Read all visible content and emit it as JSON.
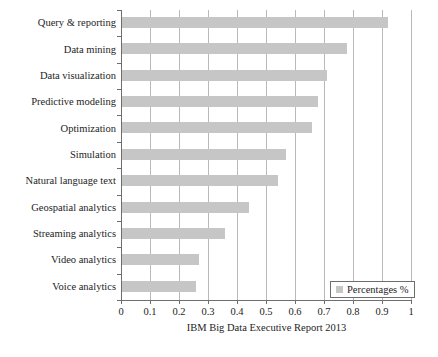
{
  "chart_data": {
    "type": "bar",
    "orientation": "horizontal",
    "title": "",
    "xlabel": "IBM Big Data Executive Report 2013",
    "ylabel": "",
    "xlim": [
      0,
      1
    ],
    "grid": "vertical",
    "legend_position": "bottom-right",
    "bar_color": "#c6c6c6",
    "categories": [
      "Query & reporting",
      "Data mining",
      "Data visualization",
      "Predictive modeling",
      "Optimization",
      "Simulation",
      "Natural language text",
      "Geospatial analytics",
      "Streaming analytics",
      "Video analytics",
      "Voice analytics"
    ],
    "values": [
      0.92,
      0.78,
      0.71,
      0.68,
      0.66,
      0.57,
      0.54,
      0.44,
      0.36,
      0.27,
      0.26
    ],
    "series": [
      {
        "name": "Percentages %",
        "values": [
          0.92,
          0.78,
          0.71,
          0.68,
          0.66,
          0.57,
          0.54,
          0.44,
          0.36,
          0.27,
          0.26
        ]
      }
    ],
    "xticks": [
      0,
      0.1,
      0.2,
      0.3,
      0.4,
      0.5,
      0.6,
      0.7,
      0.8,
      0.9,
      1
    ],
    "xtick_labels": [
      "0",
      "0.1",
      "0.2",
      "0.3",
      "0.4",
      "0.5",
      "0.6",
      "0.7",
      "0.8",
      "0.9",
      "1"
    ]
  },
  "legend": {
    "label": "Percentages %",
    "swatch_color": "#c6c6c6"
  },
  "axis": {
    "x_title": "IBM Big Data Executive Report 2013"
  }
}
